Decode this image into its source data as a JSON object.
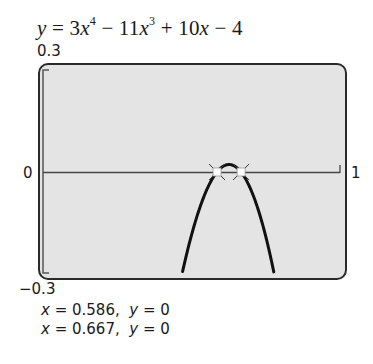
{
  "chart_data": {
    "type": "line",
    "equation": {
      "lhs": "y",
      "terms": [
        "3x^4",
        "− 11x^3",
        "+ 10x",
        "− 4"
      ]
    },
    "xlabel": "",
    "ylabel": "",
    "xlim": [
      0,
      1
    ],
    "ylim": [
      -0.3,
      0.3
    ],
    "x_tick_labels": {
      "min": "0",
      "max": "1"
    },
    "y_tick_labels": {
      "max": "0.3",
      "min": "−0.3"
    },
    "grid": false,
    "coefficients": {
      "a4": 3,
      "a3": -11,
      "a2": 0,
      "a1": 10,
      "a0": -4
    },
    "plotted_x_range": [
      0.47,
      0.777
    ],
    "series": [
      {
        "name": "y = 3x^4 − 11x^3 + 10x − 4",
        "x": [
          0.47,
          0.5,
          0.55,
          0.586,
          0.6,
          0.62,
          0.64,
          0.667,
          0.7,
          0.75,
          0.777
        ],
        "y": [
          -0.295,
          -0.188,
          -0.062,
          0.0,
          0.013,
          0.022,
          0.017,
          0.0,
          -0.036,
          -0.16,
          -0.29
        ]
      }
    ],
    "marked_points": [
      {
        "x": 0.586,
        "y": 0
      },
      {
        "x": 0.667,
        "y": 0
      }
    ],
    "annotations": [
      "x = 0.586,  y = 0",
      "x = 0.667,  y = 0"
    ]
  },
  "labels": {
    "y_max": "0.3",
    "y_min": "−0.3",
    "x_min": "0",
    "x_max": "1"
  },
  "results": [
    {
      "x_label": "x",
      "x_value": "= 0.586,",
      "y_label": "y",
      "y_value": "= 0"
    },
    {
      "x_label": "x",
      "x_value": "= 0.667,",
      "y_label": "y",
      "y_value": "= 0"
    }
  ]
}
